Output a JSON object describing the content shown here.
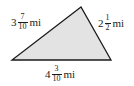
{
  "diagram": {
    "shape": "triangle",
    "fill_color": "#e3e3e3",
    "stroke_color": "#1a1a1a",
    "vertices": [
      [
        81,
        7
      ],
      [
        12,
        60
      ],
      [
        111,
        60
      ]
    ],
    "sides": {
      "left": {
        "whole": "3",
        "numerator": "7",
        "denominator": "10",
        "unit": "mi"
      },
      "right": {
        "whole": "2",
        "numerator": "1",
        "denominator": "2",
        "unit": "mi"
      },
      "bottom": {
        "whole": "4",
        "numerator": "3",
        "denominator": "10",
        "unit": "mi"
      }
    }
  }
}
